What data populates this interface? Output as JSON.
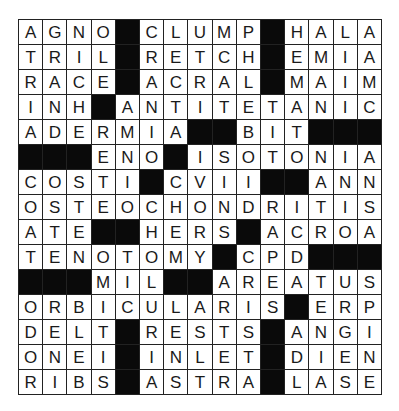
{
  "puzzle": {
    "type": "crossword",
    "size": {
      "rows": 15,
      "cols": 15
    },
    "block_color": "#0a0a0a",
    "rows": [
      "AGNO#CLUMP#HALA",
      "TRIL#RETCH#EMIA",
      "RACE#ACRAL#MAIM",
      "INH#ANTITETANIC",
      "ADERMIA##BIT###",
      "###ENO#ISOTONIA",
      "COSTI#CVII##ANN",
      "OSTEOCHONDRITIS",
      "ATE##HERS#ACROA",
      "TENOTOMY#CPD###",
      "###MIL##AREATUS",
      "ORBICULARIS#ERP",
      "DELT#RESTS#ANGI",
      "ONEI#INLET#DIEN",
      "RIBS#ASTRA#LASE"
    ]
  }
}
